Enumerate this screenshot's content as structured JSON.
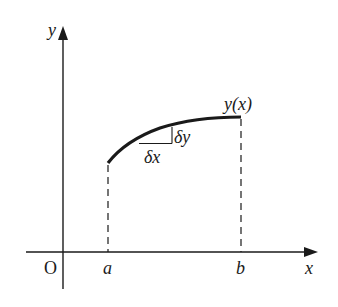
{
  "diagram": {
    "title": "",
    "axes": {
      "x_label": "x",
      "y_label": "y",
      "origin_label": "O"
    },
    "points": {
      "a_label": "a",
      "b_label": "b"
    },
    "curve": {
      "label": "y(x)",
      "description": "Concave-down curve y(x) from x=a to x=b with dashed verticals down to x-axis"
    },
    "increment": {
      "dx_label": "δx",
      "dy_label": "δy"
    },
    "colors": {
      "ink": "#1a1a1a",
      "background": "#ffffff"
    }
  }
}
